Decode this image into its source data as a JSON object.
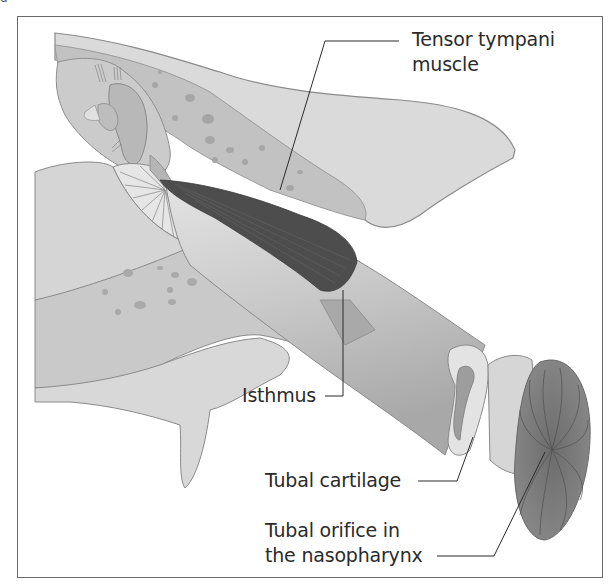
{
  "figure": {
    "corner_mark": "g",
    "colors": {
      "frame": "#6a6a6a",
      "bone": "#c7c7c7",
      "bone_light": "#d9d9d9",
      "muscle": "#4a4a4a",
      "tube": "#cfcfcf",
      "orifice": "#777777",
      "text": "#2b2b2b",
      "leader_line": "#2b2b2b"
    }
  },
  "labels": [
    {
      "id": "tensor-tympani",
      "lines": [
        "Tensor tympani",
        "muscle"
      ]
    },
    {
      "id": "isthmus",
      "lines": [
        "Isthmus"
      ]
    },
    {
      "id": "tubal-cartilage",
      "lines": [
        "Tubal cartilage"
      ]
    },
    {
      "id": "tubal-orifice",
      "lines": [
        "Tubal orifice in",
        "the nasopharynx"
      ]
    }
  ]
}
